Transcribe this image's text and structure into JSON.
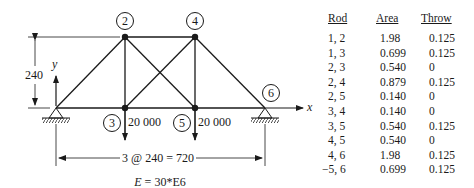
{
  "figure": {
    "joints": [
      {
        "id": "1",
        "label": "",
        "x": 56,
        "y": 108
      },
      {
        "id": "2",
        "label": "2",
        "x": 125,
        "y": 37
      },
      {
        "id": "3",
        "label": "3",
        "x": 125,
        "y": 108
      },
      {
        "id": "4",
        "label": "4",
        "x": 195,
        "y": 37
      },
      {
        "id": "5",
        "label": "5",
        "x": 195,
        "y": 108
      },
      {
        "id": "6",
        "label": "6",
        "x": 265,
        "y": 108
      }
    ],
    "joint_labels": {
      "j2": "2",
      "j3": "3",
      "j4": "4",
      "j5": "5",
      "j6": "6"
    },
    "loads": {
      "joint3": "20 000",
      "joint5": "20 000"
    },
    "height_dimension": "240",
    "span_dimension": "3 @ 240 = 720",
    "axis_x": "x",
    "axis_y": "y",
    "modulus": "E = 30*E6",
    "modulus_symbol": "E",
    "modulus_value": " = 30*E6"
  },
  "table": {
    "headers": {
      "rod": "Rod",
      "area": "Area",
      "throw": "Throw"
    },
    "rows": [
      {
        "rod": "1, 2",
        "area": "1.98",
        "throw": "0.125"
      },
      {
        "rod": "1, 3",
        "area": "0.699",
        "throw": "0.125"
      },
      {
        "rod": "2, 3",
        "area": "0.540",
        "throw": "0"
      },
      {
        "rod": "2, 4",
        "area": "0.879",
        "throw": "0.125"
      },
      {
        "rod": "2, 5",
        "area": "0.140",
        "throw": "0"
      },
      {
        "rod": "3, 4",
        "area": "0.140",
        "throw": "0"
      },
      {
        "rod": "3, 5",
        "area": "0.540",
        "throw": "0.125"
      },
      {
        "rod": "4, 5",
        "area": "0.540",
        "throw": "0"
      },
      {
        "rod": "4, 6",
        "area": "1.98",
        "throw": "0.125"
      },
      {
        "rod": "−5, 6",
        "area": "0.699",
        "throw": "0.125"
      }
    ]
  }
}
